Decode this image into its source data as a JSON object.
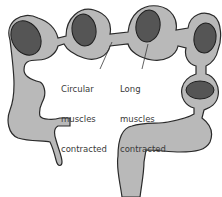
{
  "diagram": {
    "colors": {
      "tube_fill": "#b9b9b9",
      "tube_stroke": "#2a2a2a",
      "content_fill": "#555555",
      "background": "#ffffff"
    },
    "labels": [
      {
        "id": "circular",
        "lines": [
          "Circular",
          "muscles",
          "contracted"
        ]
      },
      {
        "id": "long",
        "lines": [
          "Long",
          "muscles",
          "contracted"
        ]
      }
    ],
    "cropped_caption": ""
  }
}
